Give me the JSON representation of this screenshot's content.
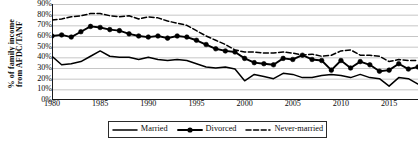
{
  "chart_data": {
    "type": "line",
    "title": "",
    "xlabel": "",
    "ylabel_line1": "% of family income",
    "ylabel_line2": "from AFDC/TANF",
    "xlim": [
      1980,
      2018
    ],
    "ylim": [
      0,
      90
    ],
    "grid": true,
    "legend_position": "bottom",
    "y_ticks": [
      "0%",
      "10%",
      "20%",
      "30%",
      "40%",
      "50%",
      "60%",
      "70%",
      "80%",
      "90%"
    ],
    "y_tick_values": [
      0,
      10,
      20,
      30,
      40,
      50,
      60,
      70,
      80,
      90
    ],
    "x_ticks": [
      "1980",
      "1985",
      "1990",
      "1995",
      "2000",
      "2005",
      "2010",
      "2015"
    ],
    "x_tick_values": [
      1980,
      1985,
      1990,
      1995,
      2000,
      2005,
      2010,
      2015
    ],
    "x": [
      1980,
      1981,
      1982,
      1983,
      1984,
      1985,
      1986,
      1987,
      1988,
      1989,
      1990,
      1991,
      1992,
      1993,
      1994,
      1995,
      1996,
      1997,
      1998,
      1999,
      2000,
      2001,
      2002,
      2003,
      2004,
      2005,
      2006,
      2007,
      2008,
      2009,
      2010,
      2011,
      2012,
      2013,
      2014,
      2015,
      2016,
      2017,
      2018
    ],
    "series": [
      {
        "name": "Married",
        "style": "solid",
        "marker": "none",
        "color": "#000000",
        "values": [
          41,
          33,
          34,
          36,
          41,
          46,
          41,
          40,
          40,
          38,
          40,
          38,
          37,
          38,
          37,
          34,
          31,
          30,
          31,
          29,
          18,
          24,
          22,
          20,
          25,
          24,
          21,
          21,
          23,
          24,
          23,
          21,
          24,
          21,
          20,
          13,
          21,
          20,
          15
        ]
      },
      {
        "name": "Divorced",
        "style": "solid",
        "marker": "circle",
        "color": "#000000",
        "values": [
          60,
          61,
          59,
          64,
          69,
          68,
          66,
          65,
          62,
          60,
          59,
          60,
          58,
          60,
          59,
          56,
          52,
          48,
          46,
          45,
          39,
          35,
          34,
          33,
          39,
          38,
          42,
          38,
          37,
          28,
          37,
          30,
          36,
          33,
          27,
          28,
          34,
          29,
          31
        ]
      },
      {
        "name": "Never-married",
        "style": "dashed",
        "marker": "none",
        "color": "#000000",
        "values": [
          75,
          76,
          78,
          79,
          81,
          81,
          79,
          78,
          79,
          76,
          78,
          77,
          74,
          72,
          70,
          65,
          60,
          56,
          52,
          47,
          45,
          45,
          44,
          44,
          45,
          44,
          42,
          43,
          41,
          42,
          46,
          47,
          42,
          42,
          41,
          36,
          38,
          37,
          37
        ]
      }
    ],
    "legend": [
      {
        "label": "Married",
        "style": "solid",
        "marker": "none"
      },
      {
        "label": "Divorced",
        "style": "solid",
        "marker": "circle"
      },
      {
        "label": "Never-married",
        "style": "dashed",
        "marker": "none"
      }
    ]
  }
}
